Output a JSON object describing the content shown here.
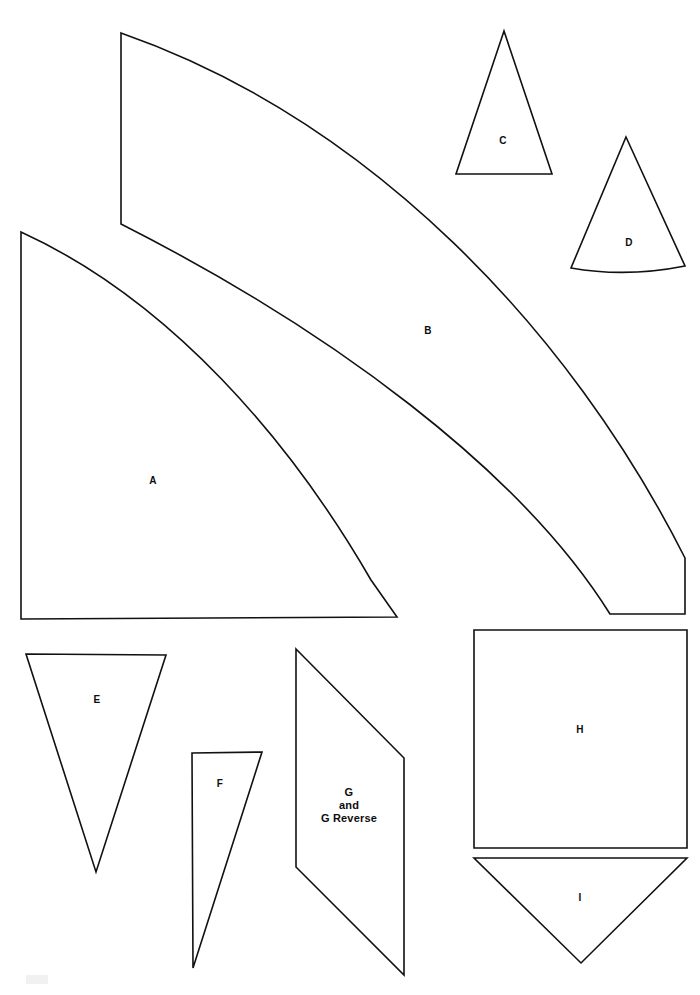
{
  "page": {
    "background_color": "#ffffff",
    "line_color": "#111111",
    "width": 700,
    "height": 995
  },
  "pieces": [
    {
      "id": "A",
      "label": "A",
      "shape": "quarter-arc-wedge",
      "label_x": 153,
      "label_y": 481,
      "path": "M 21 232 L 21 619 L 397 617 L 371 580 C 290 440 170 300 21 232 Z"
    },
    {
      "id": "B",
      "label": "B",
      "shape": "curved-arc-band",
      "label_x": 428,
      "label_y": 331,
      "path": "M 121 33 L 121 224 C 330 330 520 470 610 614 L 685 614 L 685 558 C 570 330 370 120 121 33 Z"
    },
    {
      "id": "C",
      "label": "C",
      "shape": "isoceles-triangle",
      "label_x": 503,
      "label_y": 141,
      "path": "M 504 31 L 552 174 L 456 174 Z"
    },
    {
      "id": "D",
      "label": "D",
      "shape": "triangle-concave-base",
      "label_x": 629,
      "label_y": 243,
      "path": "M 626 137 L 685 266 C 645 274 605 274 571 268 Z"
    },
    {
      "id": "E",
      "label": "E",
      "shape": "inverted-triangle",
      "label_x": 97,
      "label_y": 700,
      "path": "M 26 654 L 166 655 L 96 872 Z"
    },
    {
      "id": "F",
      "label": "F",
      "shape": "narrow-right-triangle",
      "label_x": 220,
      "label_y": 784,
      "path": "M 192 753 L 262 752 L 193 968 Z"
    },
    {
      "id": "G",
      "label": "G\nand\nG Reverse",
      "shape": "parallelogram",
      "label_x": 349,
      "label_y": 806,
      "path": "M 296 649 L 404 758 L 404 975 L 296 867 Z"
    },
    {
      "id": "H",
      "label": "H",
      "shape": "square",
      "label_x": 580,
      "label_y": 730,
      "path": "M 474 630 L 687 630 L 687 848 L 474 848 Z"
    },
    {
      "id": "I",
      "label": "I",
      "shape": "inverted-triangle",
      "label_x": 580,
      "label_y": 898,
      "path": "M 474 858 L 687 858 L 581 963 Z"
    }
  ]
}
